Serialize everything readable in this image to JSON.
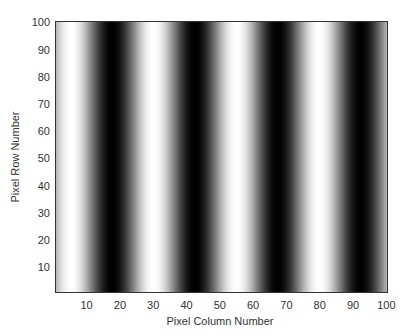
{
  "chart_data": {
    "type": "heatmap",
    "title": "",
    "xlabel": "Pixel Column Number",
    "ylabel": "Pixel Row Number",
    "xlim": [
      0.5,
      100.5
    ],
    "ylim": [
      0.5,
      100.5
    ],
    "x_ticks": [
      10,
      20,
      30,
      40,
      50,
      60,
      70,
      80,
      90,
      100
    ],
    "y_ticks": [
      10,
      20,
      30,
      40,
      50,
      60,
      70,
      80,
      90,
      100
    ],
    "colormap": "gray",
    "pattern": {
      "function": "cosine",
      "period_columns": 25,
      "bright_peak_columns": [
        5,
        30,
        55,
        80
      ],
      "dark_trough_columns": [
        17.5,
        42.5,
        67.5,
        92.5
      ]
    },
    "grid": false,
    "legend": null
  }
}
